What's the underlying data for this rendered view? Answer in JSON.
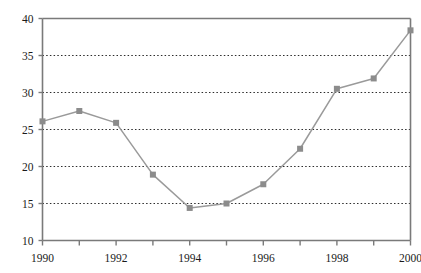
{
  "chart_data": {
    "type": "line",
    "title": "",
    "subtitle": "",
    "xlabel": "",
    "ylabel": "",
    "x": [
      1990,
      1991,
      1992,
      1993,
      1994,
      1995,
      1996,
      1997,
      1998,
      1999,
      2000
    ],
    "values": [
      26.1,
      27.5,
      25.9,
      18.9,
      14.4,
      15.0,
      17.6,
      22.4,
      30.5,
      31.9,
      38.4
    ],
    "series": [
      {
        "name": "",
        "values": [
          26.1,
          27.5,
          25.9,
          18.9,
          14.4,
          15.0,
          17.6,
          22.4,
          30.5,
          31.9,
          38.4
        ]
      }
    ],
    "xlim": [
      1990,
      2000
    ],
    "ylim": [
      10,
      40
    ],
    "y_ticks": [
      10,
      15,
      20,
      25,
      30,
      35,
      40
    ],
    "y_tick_labels": [
      "10",
      "15",
      "20",
      "25",
      "30",
      "35",
      "40"
    ],
    "x_ticks": [
      1990,
      1991,
      1992,
      1993,
      1994,
      1995,
      1996,
      1997,
      1998,
      1999,
      2000
    ],
    "x_tick_labels": [
      "1990",
      "",
      "1992",
      "",
      "1994",
      "",
      "1996",
      "",
      "1998",
      "",
      "2000"
    ],
    "x_labeled_ticks": [
      "1990",
      "1992",
      "1994",
      "1996",
      "1998",
      "2000"
    ],
    "grid": {
      "horizontal": true,
      "vertical": false,
      "style": "dotted"
    },
    "legend": {
      "visible": false,
      "position": "none",
      "entries": []
    },
    "marker": {
      "shape": "square",
      "size": 6
    },
    "colors": {
      "line": "#9a9a9a",
      "marker": "#8c8c8c",
      "grid": "#2b2b2b",
      "axis": "#7a7a7a",
      "text": "#1a1a1a",
      "background": "#ffffff"
    },
    "annotations": []
  }
}
